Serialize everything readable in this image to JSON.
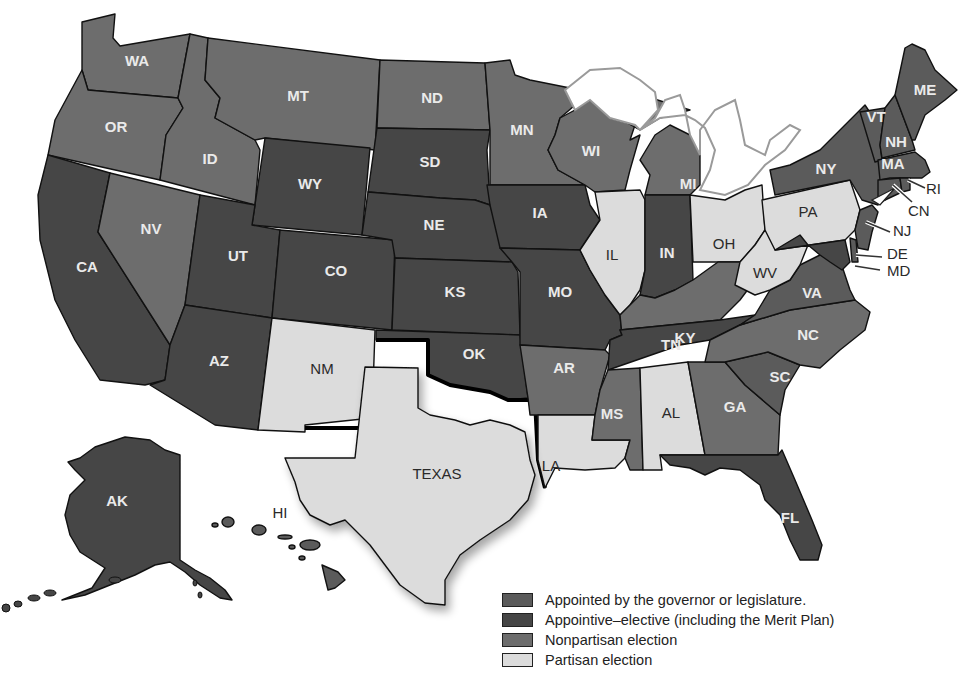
{
  "map": {
    "type": "choropleth",
    "subject": "Methods of selecting state judges",
    "colors": {
      "appointed": "#5b5b5b",
      "appointive_elective": "#464646",
      "nonpartisan": "#6d6d6d",
      "partisan": "#dcdcdc"
    }
  },
  "legend": {
    "items": [
      {
        "key": "appointed",
        "label": "Appointed by the governor or legislature.",
        "color": "#5b5b5b"
      },
      {
        "key": "appointive_elective",
        "label": "Appointive–elective (including the Merit Plan)",
        "color": "#464646"
      },
      {
        "key": "nonpartisan",
        "label": "Nonpartisan election",
        "color": "#6d6d6d"
      },
      {
        "key": "partisan",
        "label": "Partisan election",
        "color": "#dcdcdc"
      }
    ]
  },
  "states": {
    "WA": {
      "label": "WA",
      "category": "nonpartisan"
    },
    "OR": {
      "label": "OR",
      "category": "nonpartisan"
    },
    "CA": {
      "label": "CA",
      "category": "appointive_elective"
    },
    "NV": {
      "label": "NV",
      "category": "nonpartisan"
    },
    "ID": {
      "label": "ID",
      "category": "nonpartisan"
    },
    "MT": {
      "label": "MT",
      "category": "nonpartisan"
    },
    "WY": {
      "label": "WY",
      "category": "appointive_elective"
    },
    "UT": {
      "label": "UT",
      "category": "appointive_elective"
    },
    "AZ": {
      "label": "AZ",
      "category": "appointive_elective"
    },
    "CO": {
      "label": "CO",
      "category": "appointive_elective"
    },
    "NM": {
      "label": "NM",
      "category": "partisan"
    },
    "ND": {
      "label": "ND",
      "category": "nonpartisan"
    },
    "SD": {
      "label": "SD",
      "category": "appointive_elective"
    },
    "NE": {
      "label": "NE",
      "category": "appointive_elective"
    },
    "KS": {
      "label": "KS",
      "category": "appointive_elective"
    },
    "OK": {
      "label": "OK",
      "category": "appointive_elective"
    },
    "TX": {
      "label": "TEXAS",
      "category": "partisan"
    },
    "MN": {
      "label": "MN",
      "category": "nonpartisan"
    },
    "IA": {
      "label": "IA",
      "category": "appointive_elective"
    },
    "MO": {
      "label": "MO",
      "category": "appointive_elective"
    },
    "AR": {
      "label": "AR",
      "category": "nonpartisan"
    },
    "LA": {
      "label": "LA",
      "category": "partisan"
    },
    "WI": {
      "label": "WI",
      "category": "nonpartisan"
    },
    "IL": {
      "label": "IL",
      "category": "partisan"
    },
    "MI": {
      "label": "MI",
      "category": "nonpartisan"
    },
    "IN": {
      "label": "IN",
      "category": "appointive_elective"
    },
    "OH": {
      "label": "OH",
      "category": "partisan"
    },
    "KY": {
      "label": "KY",
      "category": "nonpartisan"
    },
    "TN": {
      "label": "TN",
      "category": "appointive_elective"
    },
    "MS": {
      "label": "MS",
      "category": "nonpartisan"
    },
    "AL": {
      "label": "AL",
      "category": "partisan"
    },
    "GA": {
      "label": "GA",
      "category": "nonpartisan"
    },
    "FL": {
      "label": "FL",
      "category": "appointive_elective"
    },
    "SC": {
      "label": "SC",
      "category": "appointed"
    },
    "NC": {
      "label": "NC",
      "category": "nonpartisan"
    },
    "VA": {
      "label": "VA",
      "category": "appointed"
    },
    "WV": {
      "label": "WV",
      "category": "partisan"
    },
    "PA": {
      "label": "PA",
      "category": "partisan"
    },
    "NY": {
      "label": "NY",
      "category": "appointed"
    },
    "VT": {
      "label": "VT",
      "category": "appointed"
    },
    "NH": {
      "label": "NH",
      "category": "appointed"
    },
    "ME": {
      "label": "ME",
      "category": "appointed"
    },
    "MA": {
      "label": "MA",
      "category": "appointed"
    },
    "RI": {
      "label": "RI",
      "category": "appointed"
    },
    "CN": {
      "label": "CN",
      "category": "appointed"
    },
    "NJ": {
      "label": "NJ",
      "category": "appointed"
    },
    "DE": {
      "label": "DE",
      "category": "appointed"
    },
    "MD": {
      "label": "MD",
      "category": "appointive_elective"
    },
    "AK": {
      "label": "AK",
      "category": "appointive_elective"
    },
    "HI": {
      "label": "HI",
      "category": "appointed"
    }
  }
}
